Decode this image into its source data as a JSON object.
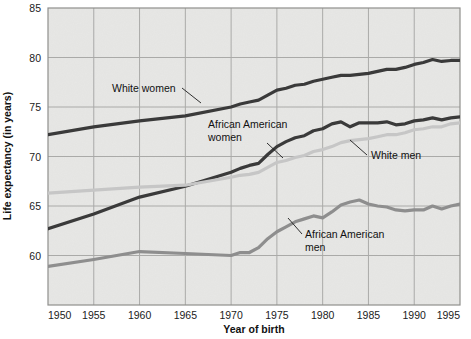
{
  "chart_data": {
    "type": "line",
    "title": "",
    "xlabel": "Year of birth",
    "ylabel": "Life expectancy (in years)",
    "xlim": [
      1950,
      1995
    ],
    "ylim": [
      55,
      85
    ],
    "xticks": [
      1950,
      1955,
      1960,
      1965,
      1970,
      1975,
      1980,
      1985,
      1990,
      1995
    ],
    "yticks": [
      60,
      65,
      70,
      75,
      80,
      85
    ],
    "grid": true,
    "legend_position": "inline-annotations",
    "x": [
      1950,
      1955,
      1960,
      1965,
      1970,
      1971,
      1972,
      1973,
      1974,
      1975,
      1976,
      1977,
      1978,
      1979,
      1980,
      1981,
      1982,
      1983,
      1984,
      1985,
      1986,
      1987,
      1988,
      1989,
      1990,
      1991,
      1992,
      1993,
      1994,
      1995
    ],
    "series": [
      {
        "name": "White women",
        "color": "#3a3a3a",
        "width": 3.2,
        "values": [
          72.2,
          73.0,
          73.6,
          74.1,
          75.0,
          75.3,
          75.5,
          75.7,
          76.2,
          76.7,
          76.9,
          77.2,
          77.3,
          77.6,
          77.8,
          78.0,
          78.2,
          78.2,
          78.3,
          78.4,
          78.6,
          78.8,
          78.8,
          79.0,
          79.3,
          79.5,
          79.8,
          79.6,
          79.7,
          79.7
        ]
      },
      {
        "name": "African American women",
        "color": "#3a3a3a",
        "width": 3.2,
        "values": [
          62.7,
          64.2,
          65.9,
          67.0,
          68.4,
          68.8,
          69.1,
          69.3,
          70.2,
          71.0,
          71.5,
          71.9,
          72.1,
          72.6,
          72.8,
          73.3,
          73.5,
          73.0,
          73.4,
          73.4,
          73.4,
          73.5,
          73.2,
          73.3,
          73.6,
          73.7,
          73.9,
          73.7,
          73.9,
          74.0
        ]
      },
      {
        "name": "White men",
        "color": "#c6c6c6",
        "width": 3.2,
        "values": [
          66.3,
          66.6,
          66.9,
          67.1,
          67.9,
          68.1,
          68.2,
          68.4,
          68.9,
          69.4,
          69.6,
          69.9,
          70.1,
          70.5,
          70.7,
          71.0,
          71.4,
          71.6,
          71.7,
          71.8,
          72.0,
          72.2,
          72.2,
          72.4,
          72.7,
          72.8,
          73.0,
          73.0,
          73.3,
          73.4
        ]
      },
      {
        "name": "African American men",
        "color": "#8e8e8e",
        "width": 3.2,
        "values": [
          58.9,
          59.6,
          60.4,
          60.2,
          60.0,
          60.3,
          60.3,
          60.8,
          61.7,
          62.4,
          62.9,
          63.4,
          63.7,
          64.0,
          63.8,
          64.4,
          65.1,
          65.4,
          65.6,
          65.2,
          65.0,
          64.9,
          64.6,
          64.5,
          64.6,
          64.6,
          65.0,
          64.7,
          65.0,
          65.2
        ]
      }
    ],
    "annotations": [
      {
        "label": "White women",
        "lines": [
          "White women"
        ],
        "text_x": 112,
        "text_y": 92,
        "leader": [
          [
            182,
            88
          ],
          [
            201,
            103
          ]
        ]
      },
      {
        "label": "African American women",
        "lines": [
          "African American",
          "women"
        ],
        "text_x": 208,
        "text_y": 128,
        "leader": [
          [
            267,
            143
          ],
          [
            283,
            158
          ]
        ]
      },
      {
        "label": "White men",
        "lines": [
          "White men"
        ],
        "text_x": 371,
        "text_y": 159,
        "leader": [
          [
            367,
            155
          ],
          [
            350,
            140
          ]
        ]
      },
      {
        "label": "African American men",
        "lines": [
          "African American",
          "men"
        ],
        "text_x": 305,
        "text_y": 238,
        "leader": [
          [
            302,
            234
          ],
          [
            288,
            218
          ]
        ]
      }
    ]
  },
  "plot": {
    "bg_color": "#e7e7e5",
    "grid_color": "#aaaaa8",
    "border_color": "#8f8f8d"
  }
}
